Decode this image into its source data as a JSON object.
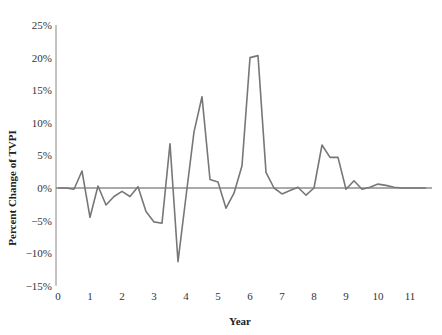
{
  "chart_data": {
    "type": "line",
    "title": "",
    "xlabel": "Year",
    "ylabel": "Percent Change of TVPI",
    "xlim": [
      0,
      11.65
    ],
    "ylim": [
      -15,
      25
    ],
    "x_ticks": [
      0,
      1,
      2,
      3,
      4,
      5,
      6,
      7,
      8,
      9,
      10,
      11
    ],
    "x_tick_labels": [
      "0",
      "1",
      "2",
      "3",
      "4",
      "5",
      "6",
      "7",
      "8",
      "9",
      "10",
      "11"
    ],
    "y_ticks": [
      25,
      20,
      15,
      10,
      5,
      0,
      -5,
      -10,
      -15
    ],
    "y_tick_labels": [
      "25%",
      "20%",
      "15%",
      "10%",
      "5%",
      "0%",
      "−5%",
      "−10%",
      "−15%"
    ],
    "grid": false,
    "legend": null,
    "zero_line": true,
    "series": [
      {
        "name": "Percent Change of TVPI",
        "color": "#777777",
        "x": [
          0,
          0.25,
          0.5,
          0.75,
          1.0,
          1.25,
          1.5,
          1.75,
          2.0,
          2.25,
          2.5,
          2.75,
          3.0,
          3.25,
          3.5,
          3.75,
          4.0,
          4.25,
          4.5,
          4.75,
          5.0,
          5.25,
          5.5,
          5.75,
          6.0,
          6.25,
          6.5,
          6.75,
          7.0,
          7.25,
          7.5,
          7.75,
          8.0,
          8.25,
          8.5,
          8.75,
          9.0,
          9.25,
          9.5,
          9.75,
          10.0,
          10.25,
          10.5,
          10.75,
          11.0,
          11.25,
          11.5
        ],
        "values": [
          0.0,
          0.0,
          -0.2,
          2.6,
          -4.5,
          0.3,
          -2.6,
          -1.3,
          -0.5,
          -1.3,
          0.2,
          -3.6,
          -5.2,
          -5.4,
          6.8,
          -11.3,
          -1.3,
          8.6,
          14.0,
          1.3,
          0.9,
          -3.1,
          -0.8,
          3.4,
          20.0,
          20.3,
          2.4,
          0.0,
          -0.9,
          -0.4,
          0.1,
          -1.1,
          0.0,
          6.6,
          4.7,
          4.7,
          -0.2,
          1.1,
          -0.2,
          0.1,
          0.6,
          0.4,
          0.1,
          0.0,
          0.0,
          0.0,
          0.0
        ]
      }
    ]
  },
  "layout": {
    "plot_left": 58,
    "plot_right": 432,
    "x_per_unit": 32,
    "y_zero": 188,
    "y_per_percent": 6.52,
    "axis_color": "#888888",
    "zero_line_color": "#555555"
  }
}
